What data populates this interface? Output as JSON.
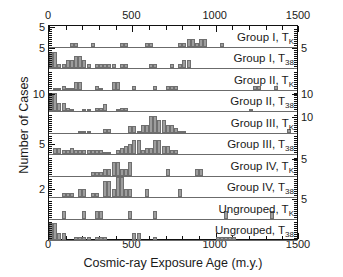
{
  "axes": {
    "xlabel": "Cosmic-ray Exposure Age (m.y.)",
    "ylabel": "Number of Cases",
    "xticks": [
      {
        "v": 0,
        "label": "0"
      },
      {
        "v": 500,
        "label": "500"
      },
      {
        "v": 1000,
        "label": "1000"
      },
      {
        "v": 1500,
        "label": "1500"
      }
    ],
    "xminor_step": 100,
    "xlim": [
      0,
      1500
    ],
    "top_axis_shown": true,
    "bottom_axis_shown": true,
    "grid": false
  },
  "style": {
    "bar_fill": "#9d9d9d",
    "bar_edge": "#6f6f6f",
    "frame": "#111111",
    "baseline": "#6b6b6b"
  },
  "chart_data": {
    "type": "bar",
    "title": "",
    "xlabel": "Cosmic-ray Exposure Age (m.y.)",
    "ylabel": "Number of Cases",
    "xlim": [
      0,
      1500
    ],
    "bin_width": 25,
    "grid": false,
    "legend_position": "in-panel-right",
    "panels": [
      {
        "label": "Group I, T_K",
        "label_html": "Group I, T<sub>K</sub>",
        "ymax": 5,
        "yticks_left": [
          5
        ],
        "yticks_right": [],
        "bins": [
          {
            "x": 125,
            "y": 1
          },
          {
            "x": 150,
            "y": 1
          },
          {
            "x": 250,
            "y": 1
          },
          {
            "x": 425,
            "y": 1
          },
          {
            "x": 450,
            "y": 1
          },
          {
            "x": 575,
            "y": 1
          },
          {
            "x": 600,
            "y": 1
          },
          {
            "x": 775,
            "y": 1
          },
          {
            "x": 800,
            "y": 1
          },
          {
            "x": 825,
            "y": 2
          },
          {
            "x": 850,
            "y": 2
          },
          {
            "x": 875,
            "y": 1
          },
          {
            "x": 900,
            "y": 2
          },
          {
            "x": 925,
            "y": 2
          },
          {
            "x": 1025,
            "y": 1
          }
        ]
      },
      {
        "label": "Group I, T_38",
        "label_html": "Group I, T<sub>38</sub>",
        "ymax": 5,
        "yticks_left": [
          5
        ],
        "yticks_right": [
          5
        ],
        "bins": [
          {
            "x": 0,
            "y": 4
          },
          {
            "x": 25,
            "y": 4
          },
          {
            "x": 50,
            "y": 1
          },
          {
            "x": 75,
            "y": 1
          },
          {
            "x": 100,
            "y": 2
          },
          {
            "x": 125,
            "y": 2
          },
          {
            "x": 150,
            "y": 3
          },
          {
            "x": 175,
            "y": 3
          },
          {
            "x": 200,
            "y": 2
          },
          {
            "x": 225,
            "y": 1
          },
          {
            "x": 275,
            "y": 1
          },
          {
            "x": 300,
            "y": 1
          },
          {
            "x": 325,
            "y": 1
          },
          {
            "x": 350,
            "y": 1
          },
          {
            "x": 375,
            "y": 1
          },
          {
            "x": 425,
            "y": 1
          },
          {
            "x": 450,
            "y": 1
          },
          {
            "x": 600,
            "y": 1
          },
          {
            "x": 625,
            "y": 1
          },
          {
            "x": 725,
            "y": 1
          },
          {
            "x": 775,
            "y": 1
          },
          {
            "x": 800,
            "y": 2
          },
          {
            "x": 825,
            "y": 2
          }
        ]
      },
      {
        "label": "Group II, T_K",
        "label_html": "Group II, T<sub>K</sub>",
        "ymax": 10,
        "yticks_left": [],
        "yticks_right": [],
        "bins": [
          {
            "x": 25,
            "y": 1
          },
          {
            "x": 50,
            "y": 1
          },
          {
            "x": 75,
            "y": 2
          },
          {
            "x": 100,
            "y": 1
          },
          {
            "x": 125,
            "y": 1
          },
          {
            "x": 150,
            "y": 4
          },
          {
            "x": 175,
            "y": 4
          },
          {
            "x": 275,
            "y": 2
          },
          {
            "x": 300,
            "y": 1
          },
          {
            "x": 375,
            "y": 4
          },
          {
            "x": 400,
            "y": 4
          },
          {
            "x": 500,
            "y": 2
          },
          {
            "x": 625,
            "y": 2
          },
          {
            "x": 700,
            "y": 2
          },
          {
            "x": 725,
            "y": 2
          },
          {
            "x": 750,
            "y": 2
          },
          {
            "x": 1225,
            "y": 2
          },
          {
            "x": 1250,
            "y": 2
          },
          {
            "x": 1350,
            "y": 2
          }
        ]
      },
      {
        "label": "Group II, T_38",
        "label_html": "Group II, T<sub>38</sub>",
        "ymax": 12,
        "yticks_left": [
          10
        ],
        "yticks_right": [
          10
        ],
        "bins": [
          {
            "x": 0,
            "y": 11
          },
          {
            "x": 25,
            "y": 11
          },
          {
            "x": 50,
            "y": 5
          },
          {
            "x": 75,
            "y": 5
          },
          {
            "x": 100,
            "y": 2
          },
          {
            "x": 125,
            "y": 1
          },
          {
            "x": 200,
            "y": 1
          },
          {
            "x": 225,
            "y": 1
          },
          {
            "x": 275,
            "y": 2
          },
          {
            "x": 300,
            "y": 2
          },
          {
            "x": 325,
            "y": 4
          },
          {
            "x": 400,
            "y": 1
          },
          {
            "x": 425,
            "y": 2
          },
          {
            "x": 450,
            "y": 2
          },
          {
            "x": 1200,
            "y": 1
          }
        ]
      },
      {
        "label": "Group III, T_K",
        "label_html": "Group III, T<sub>K</sub>",
        "ymax": 13,
        "yticks_left": [],
        "yticks_right": [
          10
        ],
        "bins": [
          {
            "x": 175,
            "y": 1
          },
          {
            "x": 200,
            "y": 1
          },
          {
            "x": 225,
            "y": 1
          },
          {
            "x": 325,
            "y": 2
          },
          {
            "x": 350,
            "y": 2
          },
          {
            "x": 475,
            "y": 4
          },
          {
            "x": 500,
            "y": 4
          },
          {
            "x": 525,
            "y": 1
          },
          {
            "x": 550,
            "y": 5
          },
          {
            "x": 575,
            "y": 5
          },
          {
            "x": 600,
            "y": 11
          },
          {
            "x": 625,
            "y": 11
          },
          {
            "x": 650,
            "y": 8
          },
          {
            "x": 675,
            "y": 8
          },
          {
            "x": 700,
            "y": 5
          },
          {
            "x": 725,
            "y": 5
          },
          {
            "x": 750,
            "y": 3
          },
          {
            "x": 775,
            "y": 1
          },
          {
            "x": 800,
            "y": 1
          },
          {
            "x": 1425,
            "y": 2
          }
        ]
      },
      {
        "label": "Group III, T_38",
        "label_html": "Group III, T<sub>38</sub>",
        "ymax": 10,
        "yticks_left": [
          5
        ],
        "yticks_right": [],
        "bins": [
          {
            "x": 25,
            "y": 3
          },
          {
            "x": 50,
            "y": 3
          },
          {
            "x": 75,
            "y": 2
          },
          {
            "x": 100,
            "y": 2
          },
          {
            "x": 125,
            "y": 3
          },
          {
            "x": 150,
            "y": 2
          },
          {
            "x": 175,
            "y": 2
          },
          {
            "x": 200,
            "y": 2
          },
          {
            "x": 225,
            "y": 2
          },
          {
            "x": 250,
            "y": 2
          },
          {
            "x": 275,
            "y": 2
          },
          {
            "x": 300,
            "y": 2
          },
          {
            "x": 325,
            "y": 1
          },
          {
            "x": 350,
            "y": 1
          },
          {
            "x": 400,
            "y": 2
          },
          {
            "x": 425,
            "y": 3
          },
          {
            "x": 450,
            "y": 4
          },
          {
            "x": 475,
            "y": 5
          },
          {
            "x": 500,
            "y": 7
          },
          {
            "x": 525,
            "y": 7
          },
          {
            "x": 550,
            "y": 2
          },
          {
            "x": 575,
            "y": 3
          },
          {
            "x": 600,
            "y": 3
          },
          {
            "x": 625,
            "y": 7
          },
          {
            "x": 650,
            "y": 7
          },
          {
            "x": 675,
            "y": 4
          },
          {
            "x": 700,
            "y": 4
          },
          {
            "x": 725,
            "y": 2
          },
          {
            "x": 750,
            "y": 2
          }
        ]
      },
      {
        "label": "Group IV, T_K",
        "label_html": "Group IV, T<sub>K</sub>",
        "ymax": 6,
        "yticks_left": [],
        "yticks_right": [
          5
        ],
        "bins": [
          {
            "x": 250,
            "y": 1
          },
          {
            "x": 275,
            "y": 1
          },
          {
            "x": 300,
            "y": 1
          },
          {
            "x": 325,
            "y": 2
          },
          {
            "x": 350,
            "y": 2
          },
          {
            "x": 375,
            "y": 4
          },
          {
            "x": 400,
            "y": 4
          },
          {
            "x": 425,
            "y": 2
          },
          {
            "x": 450,
            "y": 2
          },
          {
            "x": 475,
            "y": 4
          },
          {
            "x": 700,
            "y": 2
          },
          {
            "x": 875,
            "y": 2
          },
          {
            "x": 900,
            "y": 2
          }
        ]
      },
      {
        "label": "Group IV, T_38",
        "label_html": "Group IV, T<sub>38</sub>",
        "ymax": 5,
        "yticks_left": [
          2
        ],
        "yticks_right": [],
        "bins": [
          {
            "x": 75,
            "y": 1
          },
          {
            "x": 100,
            "y": 1
          },
          {
            "x": 125,
            "y": 1
          },
          {
            "x": 175,
            "y": 2
          },
          {
            "x": 200,
            "y": 2
          },
          {
            "x": 250,
            "y": 1
          },
          {
            "x": 275,
            "y": 1
          },
          {
            "x": 325,
            "y": 4
          },
          {
            "x": 350,
            "y": 4
          },
          {
            "x": 375,
            "y": 2
          },
          {
            "x": 400,
            "y": 5
          },
          {
            "x": 425,
            "y": 5
          },
          {
            "x": 450,
            "y": 2
          },
          {
            "x": 475,
            "y": 2
          },
          {
            "x": 575,
            "y": 2
          },
          {
            "x": 775,
            "y": 2
          }
        ]
      },
      {
        "label": "Ungrouped, T_K",
        "label_html": "Ungrouped, T<sub>K</sub>",
        "ymax": 5,
        "yticks_left": [],
        "yticks_right": [
          5
        ],
        "bins": [
          {
            "x": 75,
            "y": 2
          },
          {
            "x": 200,
            "y": 2
          },
          {
            "x": 275,
            "y": 2
          },
          {
            "x": 300,
            "y": 2
          },
          {
            "x": 475,
            "y": 2
          },
          {
            "x": 625,
            "y": 2
          },
          {
            "x": 1050,
            "y": 2
          },
          {
            "x": 1325,
            "y": 2
          }
        ]
      },
      {
        "label": "Ungrouped, T_38",
        "label_html": "Ungrouped, T<sub>38</sub>",
        "ymax": 6,
        "yticks_left": [],
        "yticks_right": [],
        "bins": [
          {
            "x": 0,
            "y": 5
          },
          {
            "x": 25,
            "y": 5
          },
          {
            "x": 50,
            "y": 2
          },
          {
            "x": 75,
            "y": 2
          },
          {
            "x": 150,
            "y": 1
          },
          {
            "x": 175,
            "y": 1
          },
          {
            "x": 200,
            "y": 1
          },
          {
            "x": 225,
            "y": 1
          },
          {
            "x": 275,
            "y": 1
          },
          {
            "x": 300,
            "y": 1
          },
          {
            "x": 325,
            "y": 1
          },
          {
            "x": 500,
            "y": 2
          },
          {
            "x": 525,
            "y": 2
          },
          {
            "x": 625,
            "y": 1
          },
          {
            "x": 1000,
            "y": 1
          },
          {
            "x": 1025,
            "y": 1
          },
          {
            "x": 1050,
            "y": 1
          },
          {
            "x": 1075,
            "y": 1
          },
          {
            "x": 1100,
            "y": 1
          }
        ]
      }
    ]
  }
}
